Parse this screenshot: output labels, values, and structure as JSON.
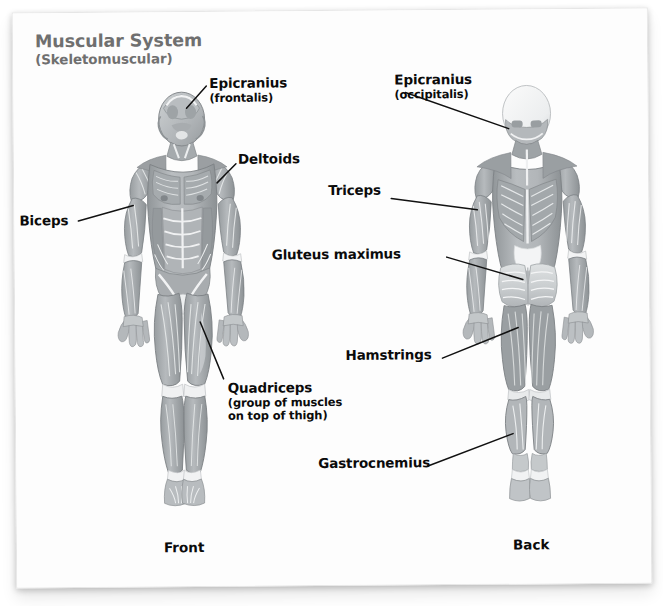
{
  "document": {
    "title_line1": "Muscular System",
    "title_line2": "(Skeletomuscular)",
    "title_color": "#6f6f6f",
    "background_color": "#ffffff",
    "page_color": "#fdfdfd",
    "label_color": "#0b0b0b",
    "leader_line_color": "#111111",
    "muscle_dark": "#8a8f92",
    "muscle_mid": "#a9aeb1",
    "muscle_light": "#cfd3d5",
    "tendon_white": "#f4f5f6"
  },
  "figures": [
    {
      "id": "front-figure",
      "caption": "Front"
    },
    {
      "id": "back-figure",
      "caption": "Back"
    }
  ],
  "labels": [
    {
      "id": "epicranius-frontalis",
      "main": "Epicranius",
      "sub": "(frontalis)",
      "figure": "front",
      "align": "left"
    },
    {
      "id": "deltoids",
      "main": "Deltoids",
      "sub": "",
      "figure": "front",
      "align": "left"
    },
    {
      "id": "biceps",
      "main": "Biceps",
      "sub": "",
      "figure": "front",
      "align": "left"
    },
    {
      "id": "quadriceps",
      "main": "Quadriceps",
      "sub": "(group of muscles",
      "sub2": "on top of thigh)",
      "figure": "front",
      "align": "left"
    },
    {
      "id": "epicranius-occipitalis",
      "main": "Epicranius",
      "sub": "(occipitalis)",
      "figure": "back",
      "align": "left"
    },
    {
      "id": "triceps",
      "main": "Triceps",
      "sub": "",
      "figure": "back",
      "align": "left"
    },
    {
      "id": "gluteus-maximus",
      "main": "Gluteus maximus",
      "sub": "",
      "figure": "back",
      "align": "left"
    },
    {
      "id": "hamstrings",
      "main": "Hamstrings",
      "sub": "",
      "figure": "back",
      "align": "left"
    },
    {
      "id": "gastrocnemius",
      "main": "Gastrocnemius",
      "sub": "",
      "figure": "back",
      "align": "left"
    }
  ],
  "captions": {
    "front": "Front",
    "back": "Back"
  }
}
